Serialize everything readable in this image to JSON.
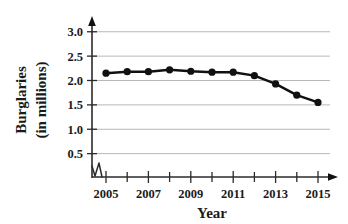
{
  "chart_data": {
    "type": "line",
    "title": "",
    "xlabel": "Year",
    "ylabel_line1": "Burglaries",
    "ylabel_line2": "(in millions)",
    "ylabel": "Burglaries (in millions)",
    "x": [
      2005,
      2006,
      2007,
      2008,
      2009,
      2010,
      2011,
      2012,
      2013,
      2014,
      2015
    ],
    "values": [
      2.15,
      2.18,
      2.18,
      2.22,
      2.19,
      2.17,
      2.17,
      2.1,
      1.93,
      1.7,
      1.55
    ],
    "series": [
      {
        "name": "Burglaries",
        "values": [
          2.15,
          2.18,
          2.18,
          2.22,
          2.19,
          2.17,
          2.17,
          2.1,
          1.93,
          1.7,
          1.55
        ]
      }
    ],
    "xlim": [
      2005,
      2015
    ],
    "ylim": [
      0,
      3.2
    ],
    "ytick_labels": [
      "3.0",
      "2.5",
      "2.0",
      "1.5",
      "1.0",
      "0.5"
    ],
    "ytick_values": [
      3.0,
      2.5,
      2.0,
      1.5,
      1.0,
      0.5
    ],
    "xtick_labels": [
      "2005",
      "2007",
      "2009",
      "2011",
      "2013",
      "2015"
    ],
    "xtick_values": [
      2005,
      2007,
      2009,
      2011,
      2013,
      2015
    ],
    "xtick_minor_values": [
      2006,
      2008,
      2010,
      2012,
      2014
    ],
    "grid": "horizontal",
    "legend": "none",
    "axis_break": "y-axis zigzag below 0.5",
    "marker": "filled-circle",
    "line_color": "#111111",
    "grid_color": "#9a9a9a",
    "axis_color": "#2b2b2b"
  }
}
